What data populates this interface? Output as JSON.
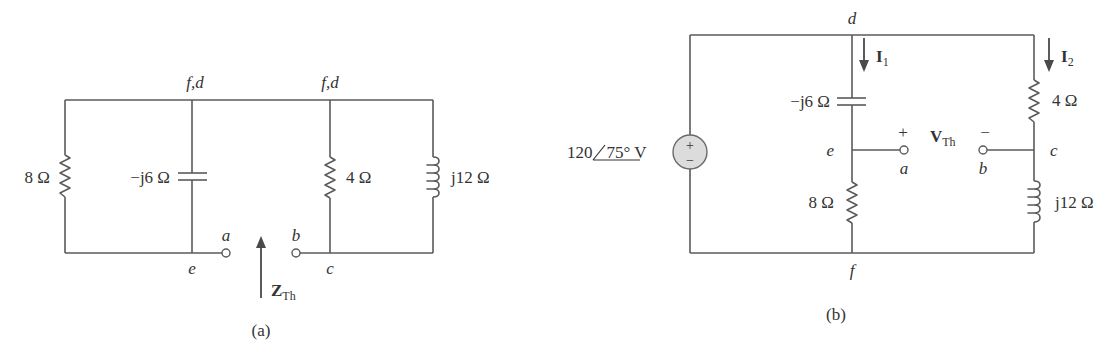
{
  "figure_a": {
    "caption": "(a)",
    "nodes": {
      "top_left": "f,d",
      "top_right": "f,d",
      "bottom_left": "e",
      "bottom_right": "c",
      "terminal_a": "a",
      "terminal_b": "b"
    },
    "components": {
      "r8": "8 Ω",
      "cap": "−j6 Ω",
      "r4": "4 Ω",
      "ind": "j12 Ω"
    },
    "zth": {
      "main": "Z",
      "sub": "Th"
    }
  },
  "figure_b": {
    "caption": "(b)",
    "source": {
      "magnitude": "120",
      "angle": "75°",
      "unit": " V",
      "plus": "+",
      "minus": "−"
    },
    "nodes": {
      "top": "d",
      "bottom": "f",
      "left_mid": "e",
      "right_mid": "c",
      "terminal_a": "a",
      "terminal_b": "b"
    },
    "components": {
      "cap": "−j6 Ω",
      "r8": "8 Ω",
      "r4": "4 Ω",
      "ind": "j12 Ω"
    },
    "currents": {
      "i1": {
        "main": "I",
        "sub": "1"
      },
      "i2": {
        "main": "I",
        "sub": "2"
      }
    },
    "vth": {
      "main": "V",
      "sub": "Th",
      "plus": "+",
      "minus": "−"
    }
  },
  "colors": {
    "wire": "#5a5a5a",
    "source_fill": "#dcdcdc",
    "text": "#333333"
  }
}
